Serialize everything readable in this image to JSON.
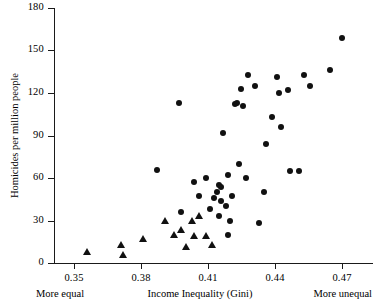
{
  "chart_data": {
    "type": "scatter",
    "title": "",
    "xlabel": "Income Inequality (Gini)",
    "ylabel": "Homicides per million people",
    "xlim": [
      0.341,
      0.472
    ],
    "ylim": [
      0,
      180
    ],
    "xticks": [
      0.35,
      0.38,
      0.41,
      0.44,
      0.47
    ],
    "xtick_labels": [
      "0.35",
      "0.38",
      "0.41",
      "0.44",
      "0.47"
    ],
    "yticks": [
      0,
      30,
      60,
      90,
      120,
      150,
      180
    ],
    "ytick_labels": [
      "0",
      "30",
      "60",
      "90",
      "120",
      "150",
      "180"
    ],
    "grid": false,
    "legend": null,
    "annotations": {
      "left": "More equal",
      "right": "More unequal"
    },
    "series": [
      {
        "name": "triangles",
        "marker": "triangle",
        "points": [
          [
            0.356,
            8
          ],
          [
            0.371,
            13
          ],
          [
            0.372,
            6
          ],
          [
            0.381,
            17
          ],
          [
            0.391,
            30
          ],
          [
            0.395,
            20
          ],
          [
            0.398,
            23
          ],
          [
            0.4,
            11
          ],
          [
            0.403,
            30
          ],
          [
            0.404,
            19
          ],
          [
            0.406,
            33
          ],
          [
            0.409,
            19
          ],
          [
            0.412,
            13
          ]
        ]
      },
      {
        "name": "circles",
        "marker": "circle",
        "points": [
          [
            0.387,
            66
          ],
          [
            0.397,
            113
          ],
          [
            0.398,
            36
          ],
          [
            0.404,
            57
          ],
          [
            0.406,
            47
          ],
          [
            0.409,
            60
          ],
          [
            0.411,
            38
          ],
          [
            0.413,
            46
          ],
          [
            0.414,
            50
          ],
          [
            0.415,
            55
          ],
          [
            0.415,
            33
          ],
          [
            0.416,
            54
          ],
          [
            0.416,
            44
          ],
          [
            0.417,
            92
          ],
          [
            0.418,
            40
          ],
          [
            0.419,
            62
          ],
          [
            0.419,
            20
          ],
          [
            0.42,
            30
          ],
          [
            0.421,
            47
          ],
          [
            0.422,
            112
          ],
          [
            0.423,
            113
          ],
          [
            0.424,
            70
          ],
          [
            0.425,
            123
          ],
          [
            0.426,
            111
          ],
          [
            0.427,
            60
          ],
          [
            0.428,
            133
          ],
          [
            0.431,
            125
          ],
          [
            0.433,
            28
          ],
          [
            0.435,
            50
          ],
          [
            0.436,
            84
          ],
          [
            0.439,
            103
          ],
          [
            0.441,
            131
          ],
          [
            0.442,
            120
          ],
          [
            0.443,
            96
          ],
          [
            0.446,
            122
          ],
          [
            0.447,
            65
          ],
          [
            0.451,
            65
          ],
          [
            0.453,
            133
          ],
          [
            0.456,
            125
          ],
          [
            0.465,
            136
          ],
          [
            0.47,
            159
          ]
        ]
      }
    ]
  }
}
